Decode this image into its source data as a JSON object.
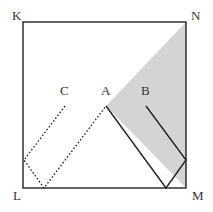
{
  "diagram": {
    "type": "geometry",
    "square": {
      "corners": {
        "K": [
          23,
          22
        ],
        "N": [
          186,
          22
        ],
        "M": [
          186,
          188
        ],
        "L": [
          23,
          188
        ]
      }
    },
    "labels": {
      "K": "K",
      "N": "N",
      "L": "L",
      "M": "M",
      "A": "A",
      "B": "B",
      "C": "C"
    },
    "points": {
      "A": [
        106,
        106
      ],
      "B": [
        146,
        106
      ],
      "C": [
        65,
        106
      ]
    },
    "shaded_region": {
      "color": "#d4d4d4",
      "vertices": [
        [
          186,
          22
        ],
        [
          106,
          106
        ],
        [
          186,
          188
        ]
      ]
    },
    "solid_path": [
      [
        106,
        106
      ],
      [
        166,
        188
      ],
      [
        186,
        160
      ],
      [
        146,
        106
      ]
    ],
    "dotted_path": [
      [
        65,
        106
      ],
      [
        24,
        160
      ],
      [
        44,
        188
      ],
      [
        106,
        106
      ]
    ],
    "colors": {
      "stroke": "#222222",
      "shade": "#d4d4d4",
      "label": "#333333"
    }
  }
}
